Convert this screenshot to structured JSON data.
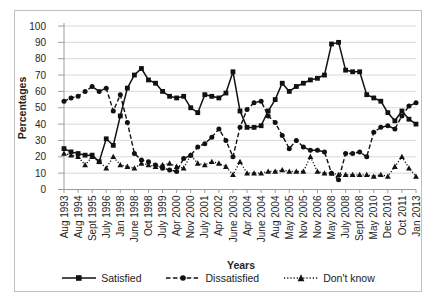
{
  "figure": {
    "type": "statistical line chart",
    "background": "#ffffff"
  },
  "colors": {
    "series": "#111111",
    "grid": "#d9d9d9",
    "axis": "#9d9d9d",
    "text": "#262626",
    "border": "#bfbfbf",
    "background": "#ffffff"
  },
  "chart_data": {
    "type": "line",
    "title": "",
    "xlabel": "Years",
    "ylabel": "Percentages",
    "ylim": [
      0,
      100
    ],
    "ytick_interval": 10,
    "y_ticks": [
      0,
      10,
      20,
      30,
      40,
      50,
      60,
      70,
      80,
      90,
      100
    ],
    "grid": "horizontal",
    "legend_position": "bottom",
    "x_labels": [
      "Aug 1993",
      "",
      "Aug 1994",
      "",
      "Sept 1995",
      "",
      "July 1996",
      "",
      "Jan 1998",
      "",
      "June 1998",
      "",
      "Oct 1998",
      "",
      "July 1999",
      "",
      "Apr 2000",
      "",
      "Nov 2000",
      "",
      "July 2001",
      "",
      "Apr 2002",
      "",
      "June 2003",
      "",
      "Apr 2004",
      "",
      "June 2004",
      "",
      "Aug 2004",
      "",
      "May 2005",
      "",
      "Nov 2005",
      "",
      "Nov 2006",
      "",
      "May 2008",
      "",
      "July 2008",
      "",
      "Sept 2008",
      "",
      "May 2010",
      "",
      "Dec 2010",
      "",
      "Oct 2011",
      "",
      "Jan 2013"
    ],
    "series": [
      {
        "name": "Satisfied",
        "line_style": "solid",
        "marker": "square",
        "color": "#111111",
        "values": [
          25,
          23,
          22,
          21,
          21,
          17,
          31,
          27,
          45,
          62,
          70,
          74,
          67,
          65,
          60,
          57,
          56,
          57,
          50,
          47,
          58,
          57,
          56,
          59,
          72,
          48,
          38,
          38,
          39,
          48,
          55,
          65,
          60,
          63,
          65,
          67,
          68,
          70,
          89,
          90,
          73,
          72,
          72,
          58,
          56,
          54,
          47,
          42,
          48,
          43,
          40
        ]
      },
      {
        "name": "Dissatisfied",
        "line_style": "dashed",
        "marker": "circle",
        "color": "#111111",
        "values": [
          54,
          56,
          57,
          60,
          63,
          60,
          62,
          48,
          58,
          41,
          22,
          18,
          17,
          15,
          13,
          12,
          11,
          19,
          21,
          26,
          28,
          32,
          37,
          30,
          20,
          38,
          49,
          53,
          54,
          45,
          41,
          33,
          25,
          30,
          26,
          24,
          24,
          23,
          10,
          6,
          22,
          22,
          23,
          20,
          35,
          38,
          39,
          37,
          45,
          51,
          53
        ]
      },
      {
        "name": "Don't know",
        "line_style": "dotted",
        "marker": "triangle",
        "color": "#111111",
        "values": [
          22,
          21,
          20,
          15,
          20,
          17,
          13,
          20,
          15,
          14,
          13,
          16,
          15,
          14,
          15,
          16,
          14,
          13,
          21,
          16,
          15,
          17,
          16,
          14,
          9,
          17,
          10,
          10,
          10,
          11,
          11,
          12,
          11,
          11,
          11,
          20,
          11,
          10,
          10,
          9,
          9,
          9,
          9,
          9,
          8,
          9,
          8,
          14,
          20,
          13,
          8
        ]
      }
    ]
  }
}
